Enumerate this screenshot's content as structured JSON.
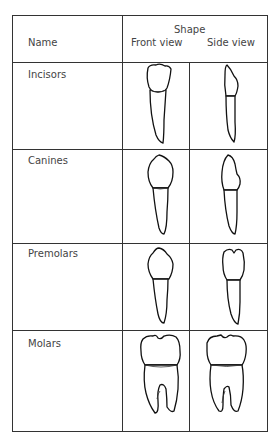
{
  "table": {
    "header": {
      "name": "Name",
      "shape": "Shape",
      "front_view": "Front view",
      "side_view": "Side view"
    },
    "rows": [
      {
        "name": "Incisors",
        "front_icon": "incisor-front",
        "side_icon": "incisor-side"
      },
      {
        "name": "Canines",
        "front_icon": "canine-front",
        "side_icon": "canine-side"
      },
      {
        "name": "Premolars",
        "front_icon": "premolar-front",
        "side_icon": "premolar-side"
      },
      {
        "name": "Molars",
        "front_icon": "molar-front",
        "side_icon": "molar-side"
      }
    ]
  }
}
